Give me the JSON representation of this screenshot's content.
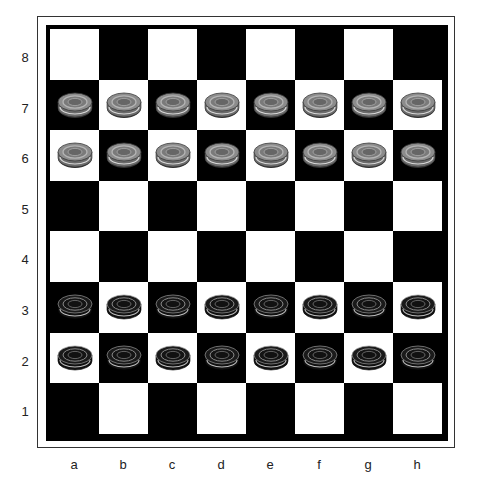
{
  "board": {
    "ranks": [
      "8",
      "7",
      "6",
      "5",
      "4",
      "3",
      "2",
      "1"
    ],
    "files": [
      "a",
      "b",
      "c",
      "d",
      "e",
      "f",
      "g",
      "h"
    ],
    "light_color": "#ffffff",
    "dark_color": "#000000"
  },
  "pieces": {
    "7": [
      "gray",
      "gray",
      "gray",
      "gray",
      "gray",
      "gray",
      "gray",
      "gray"
    ],
    "6": [
      "gray",
      "gray",
      "gray",
      "gray",
      "gray",
      "gray",
      "gray",
      "gray"
    ],
    "3": [
      "black",
      "black",
      "black",
      "black",
      "black",
      "black",
      "black",
      "black"
    ],
    "2": [
      "black",
      "black",
      "black",
      "black",
      "black",
      "black",
      "black",
      "black"
    ]
  },
  "colors": {
    "gray_piece": "#8a8a8a",
    "black_piece": "#151515"
  }
}
